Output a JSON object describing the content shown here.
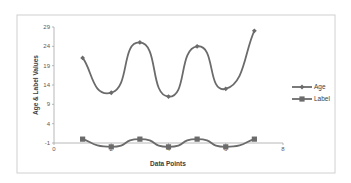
{
  "chart_data": {
    "type": "line",
    "title": "",
    "xlabel": "Data Points",
    "ylabel": "Age & Label Values",
    "xlim": [
      0,
      8
    ],
    "ylim": [
      -1,
      29
    ],
    "x_ticks": [
      0,
      2,
      4,
      6,
      8
    ],
    "y_ticks": [
      -1,
      4,
      9,
      14,
      19,
      24,
      29
    ],
    "grid": false,
    "legend_position": "right",
    "smooth": true,
    "x": [
      1,
      2,
      3,
      4,
      5,
      6,
      7
    ],
    "series": [
      {
        "name": "Age",
        "values": [
          21,
          12,
          25,
          11,
          24,
          13,
          28
        ],
        "marker": "diamond",
        "color": "#6b6b6b"
      },
      {
        "name": "Label",
        "values": [
          0,
          -2,
          0,
          -2,
          0,
          -2,
          0
        ],
        "marker": "square",
        "color": "#6b6b6b"
      }
    ]
  },
  "colors": {
    "line": "#6b6b6b",
    "axis": "#a6a6a6",
    "border": "#d0d0d0",
    "text": "#404040"
  }
}
